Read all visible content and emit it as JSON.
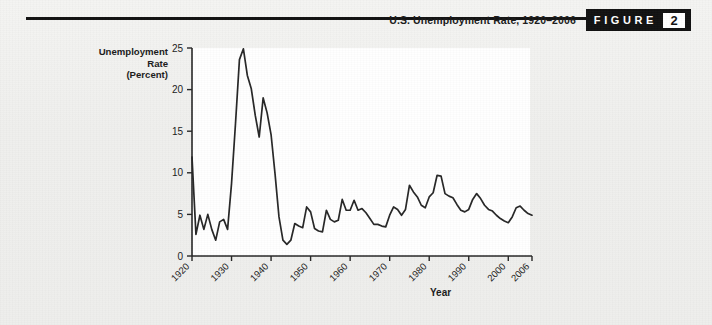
{
  "figure": {
    "title": "U.S. Unemployment Rate, 1920–2006",
    "word": "FIGURE",
    "number": "2"
  },
  "axes": {
    "y_title_line1": "Unemployment",
    "y_title_line2": "Rate",
    "y_title_line3": "(Percent)",
    "x_title": "Year",
    "y_ticks": [
      "0",
      "5",
      "10",
      "15",
      "20",
      "25"
    ],
    "x_ticks": [
      "1920",
      "1930",
      "1940",
      "1950",
      "1960",
      "1970",
      "1980",
      "1990",
      "2000",
      "2006"
    ]
  },
  "colors": {
    "line": "#262626",
    "axis": "#262626",
    "plot_background": "#ffffff",
    "page_background": "#f1f1ef",
    "badge_background": "#111111",
    "badge_text": "#ffffff"
  },
  "chart_data": {
    "type": "line",
    "title": "U.S. Unemployment Rate, 1920–2006",
    "xlabel": "Year",
    "ylabel": "Unemployment Rate (Percent)",
    "xlim": [
      1920,
      2006
    ],
    "ylim": [
      0,
      25
    ],
    "grid": false,
    "legend": null,
    "xticks": [
      1920,
      1930,
      1940,
      1950,
      1960,
      1970,
      1980,
      1990,
      2000,
      2006
    ],
    "yticks": [
      0,
      5,
      10,
      15,
      20,
      25
    ],
    "series": [
      {
        "name": "U.S. Unemployment Rate",
        "x": [
          1920,
          1921,
          1922,
          1923,
          1924,
          1925,
          1926,
          1927,
          1928,
          1929,
          1930,
          1931,
          1932,
          1933,
          1934,
          1935,
          1936,
          1937,
          1938,
          1939,
          1940,
          1941,
          1942,
          1943,
          1944,
          1945,
          1946,
          1947,
          1948,
          1949,
          1950,
          1951,
          1952,
          1953,
          1954,
          1955,
          1956,
          1957,
          1958,
          1959,
          1960,
          1961,
          1962,
          1963,
          1964,
          1965,
          1966,
          1967,
          1968,
          1969,
          1970,
          1971,
          1972,
          1973,
          1974,
          1975,
          1976,
          1977,
          1978,
          1979,
          1980,
          1981,
          1982,
          1983,
          1984,
          1985,
          1986,
          1987,
          1988,
          1989,
          1990,
          1991,
          1992,
          1993,
          1994,
          1995,
          1996,
          1997,
          1998,
          1999,
          2000,
          2001,
          2002,
          2003,
          2004,
          2005,
          2006
        ],
        "y": [
          11.9,
          2.6,
          4.9,
          3.2,
          5.0,
          3.2,
          1.9,
          4.1,
          4.4,
          3.2,
          8.7,
          15.9,
          23.6,
          24.9,
          21.7,
          20.1,
          16.9,
          14.3,
          19.0,
          17.2,
          14.6,
          9.9,
          4.7,
          1.9,
          1.4,
          1.9,
          3.9,
          3.6,
          3.4,
          5.9,
          5.3,
          3.3,
          3.0,
          2.9,
          5.5,
          4.4,
          4.1,
          4.3,
          6.8,
          5.5,
          5.5,
          6.7,
          5.5,
          5.7,
          5.2,
          4.5,
          3.8,
          3.8,
          3.6,
          3.5,
          4.9,
          5.9,
          5.6,
          4.9,
          5.6,
          8.5,
          7.7,
          7.1,
          6.1,
          5.8,
          7.1,
          7.6,
          9.7,
          9.6,
          7.5,
          7.2,
          7.0,
          6.2,
          5.5,
          5.3,
          5.6,
          6.8,
          7.5,
          6.9,
          6.1,
          5.6,
          5.4,
          4.9,
          4.5,
          4.2,
          4.0,
          4.7,
          5.8,
          6.0,
          5.5,
          5.1,
          4.9
        ]
      }
    ]
  }
}
